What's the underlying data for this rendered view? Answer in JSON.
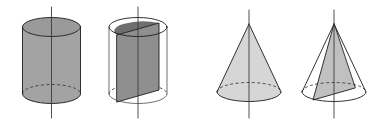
{
  "figure": {
    "background_color": "#ffffff",
    "width": 387,
    "height": 125,
    "panel_count": 4,
    "colors": {
      "outline": "#1c1c1c",
      "outline_light": "#555555",
      "hidden_edge": "#333333",
      "axis": "#3a3a3a",
      "cylinder_body_fill": "#a3a3a3",
      "cylinder_top_fill": "#9a9a9a",
      "rect_section_fill": "#8f8f8f",
      "rect_section_top_fill": "#6e6e6e",
      "cone_body_fill": "#d6d6d6",
      "triangle_section_fill": "#c0c0c0"
    },
    "panels": [
      {
        "index": 1,
        "name": "shaded-cylinder",
        "label": "Cylinder",
        "shaded": true,
        "has_axis": true,
        "has_hidden_base_arc": true,
        "center_x": 51.5,
        "radius_x": 29,
        "radius_y": 9.5,
        "top_y": 27,
        "bottom_y": 94,
        "axis_top_y": 7,
        "axis_bottom_y": 118
      },
      {
        "index": 2,
        "name": "cylinder-with-rectangular-section",
        "label": "Cylinder with axial rectangular cross-section",
        "shaded": false,
        "section": "rectangle",
        "has_axis": true,
        "has_hidden_base_arc": true,
        "center_x": 138,
        "radius_x": 29,
        "radius_y": 9.5,
        "top_y": 27,
        "bottom_y": 94,
        "axis_top_y": 7,
        "axis_bottom_y": 118,
        "section_left_x": 117,
        "section_right_x": 159,
        "section_top_left_y": 35,
        "section_top_right_y": 23,
        "section_bottom_left_y": 102,
        "section_bottom_right_y": 90
      },
      {
        "index": 3,
        "name": "shaded-cone",
        "label": "Cone",
        "shaded": true,
        "has_axis": true,
        "has_hidden_base_arc": true,
        "center_x": 249,
        "radius_x": 32,
        "radius_y": 9.5,
        "apex_y": 24,
        "base_y": 92,
        "axis_top_y": 10,
        "axis_bottom_y": 118
      },
      {
        "index": 4,
        "name": "cone-with-triangular-section",
        "label": "Cone with axial triangular cross-section",
        "shaded": false,
        "section": "triangle",
        "has_axis": true,
        "has_hidden_base_arc": true,
        "center_x": 334,
        "radius_x": 32,
        "radius_y": 9.5,
        "apex_y": 24,
        "base_y": 92,
        "axis_top_y": 10,
        "axis_bottom_y": 118,
        "section_base_left_x": 313,
        "section_base_left_y": 100,
        "section_base_right_x": 355,
        "section_base_right_y": 88
      }
    ]
  }
}
